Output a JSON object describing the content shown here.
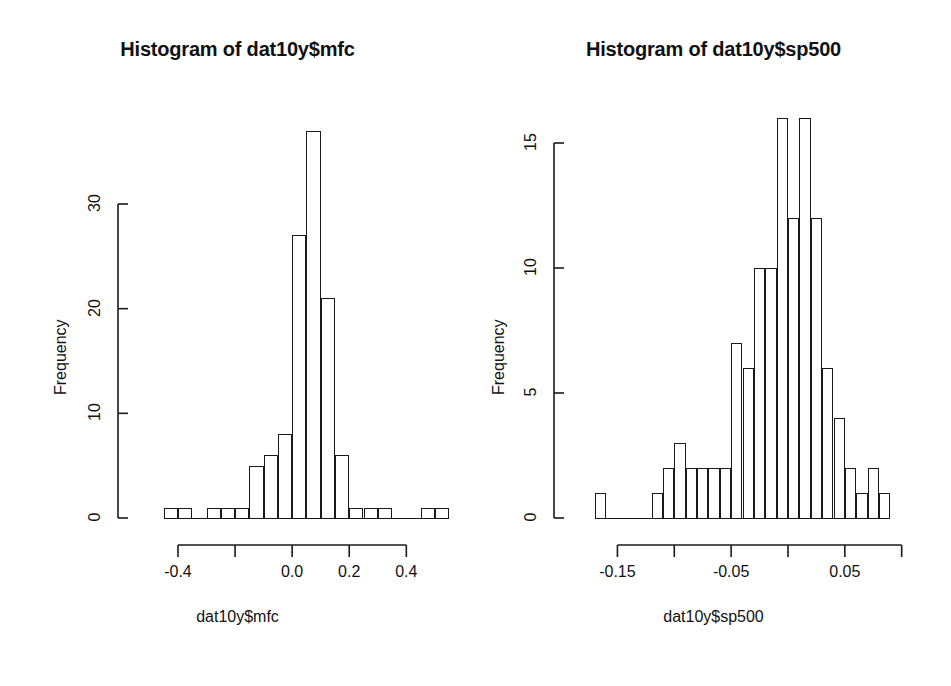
{
  "figure": {
    "background": "#ffffff",
    "ink_color": "#1a1a1a",
    "panel_count": 2
  },
  "chart_data": [
    {
      "type": "bar",
      "subtype": "histogram",
      "title": "Histogram of dat10y$mfc",
      "xlabel": "dat10y$mfc",
      "ylabel": "Frequency",
      "bin_width": 0.05,
      "bin_starts": [
        -0.45,
        -0.4,
        -0.35,
        -0.3,
        -0.25,
        -0.2,
        -0.15,
        -0.1,
        -0.05,
        0.0,
        0.05,
        0.1,
        0.15,
        0.2,
        0.25,
        0.3,
        0.35,
        0.4,
        0.45,
        0.5
      ],
      "categories": [
        "-0.45",
        "-0.40",
        "-0.35",
        "-0.30",
        "-0.25",
        "-0.20",
        "-0.15",
        "-0.10",
        "-0.05",
        "0.00",
        "0.05",
        "0.10",
        "0.15",
        "0.20",
        "0.25",
        "0.30",
        "0.35",
        "0.40",
        "0.45",
        "0.50"
      ],
      "values": [
        1,
        1,
        0,
        1,
        1,
        1,
        5,
        6,
        8,
        27,
        37,
        21,
        6,
        1,
        1,
        1,
        0,
        0,
        1,
        1
      ],
      "xlim": [
        -0.47,
        0.56
      ],
      "ylim": [
        0,
        37
      ],
      "xticks": [
        -0.4,
        -0.2,
        0.0,
        0.2,
        0.4
      ],
      "xticklabels": [
        "-0.4",
        "",
        "0.0",
        "0.2",
        "0.4"
      ],
      "yticks": [
        0,
        10,
        20,
        30
      ],
      "yticklabels": [
        "0",
        "10",
        "20",
        "30"
      ],
      "grid": false,
      "legend": "none"
    },
    {
      "type": "bar",
      "subtype": "histogram",
      "title": "Histogram of dat10y$sp500",
      "xlabel": "dat10y$sp500",
      "ylabel": "Frequency",
      "bin_width": 0.01,
      "bin_starts": [
        -0.17,
        -0.16,
        -0.15,
        -0.14,
        -0.13,
        -0.12,
        -0.11,
        -0.1,
        -0.09,
        -0.08,
        -0.07,
        -0.06,
        -0.05,
        -0.04,
        -0.03,
        -0.02,
        -0.01,
        0.0,
        0.01,
        0.02,
        0.03,
        0.04,
        0.05,
        0.06,
        0.07,
        0.08
      ],
      "categories": [
        "-0.17",
        "-0.16",
        "-0.15",
        "-0.14",
        "-0.13",
        "-0.12",
        "-0.11",
        "-0.10",
        "-0.09",
        "-0.08",
        "-0.07",
        "-0.06",
        "-0.05",
        "-0.04",
        "-0.03",
        "-0.02",
        "-0.01",
        "0.00",
        "0.01",
        "0.02",
        "0.03",
        "0.04",
        "0.05",
        "0.06",
        "0.07",
        "0.08"
      ],
      "values": [
        1,
        0,
        0,
        0,
        0,
        1,
        2,
        3,
        2,
        2,
        2,
        2,
        7,
        6,
        10,
        10,
        16,
        12,
        16,
        12,
        6,
        4,
        2,
        1,
        2,
        1
      ],
      "xlim": [
        -0.175,
        0.095
      ],
      "ylim": [
        0,
        16
      ],
      "xticks": [
        -0.15,
        -0.1,
        -0.05,
        0.0,
        0.05,
        0.1
      ],
      "xticklabels": [
        "-0.15",
        "",
        "-0.05",
        "",
        "0.05",
        ""
      ],
      "yticks": [
        0,
        5,
        10,
        15
      ],
      "yticklabels": [
        "0",
        "5",
        "10",
        "15"
      ],
      "grid": false,
      "legend": "none"
    }
  ]
}
